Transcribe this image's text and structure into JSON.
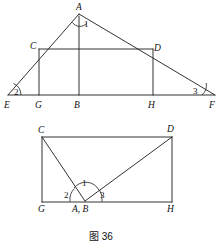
{
  "figure": {
    "caption": "图 36",
    "background_color": "#ffffff",
    "stroke_color": "#1c1c1c",
    "width": 223,
    "height": 251
  },
  "top_figure": {
    "name": "large-triangle-EAF-with-rectangle-CGHD",
    "description": "Triangle E A F with altitude A B, inscribed rectangle C G H D",
    "vertex_labels": [
      {
        "id": "A",
        "text": "A",
        "x": 76,
        "y": 3
      },
      {
        "id": "C",
        "text": "C",
        "x": 30,
        "y": 42
      },
      {
        "id": "D",
        "text": "D",
        "x": 154,
        "y": 44
      },
      {
        "id": "E",
        "text": "E",
        "x": 4,
        "y": 101
      },
      {
        "id": "G",
        "text": "G",
        "x": 35,
        "y": 101
      },
      {
        "id": "B",
        "text": "B",
        "x": 74,
        "y": 101
      },
      {
        "id": "H",
        "text": "H",
        "x": 148,
        "y": 101
      },
      {
        "id": "F",
        "text": "F",
        "x": 209,
        "y": 101
      }
    ],
    "angle_labels": [
      {
        "id": "1",
        "text": "1",
        "x": 84,
        "y": 20
      },
      {
        "id": "2",
        "text": "2",
        "x": 14,
        "y": 88
      },
      {
        "id": "3",
        "text": "3",
        "x": 193,
        "y": 87
      }
    ]
  },
  "bottom_figure": {
    "name": "rectangle-GHDC-with-angles-at-AB",
    "description": "Rectangle C D H G with segments C-AB and D-AB meeting at point A,B on side G H",
    "vertex_labels": [
      {
        "id": "C",
        "text": "C",
        "x": 38,
        "y": 126
      },
      {
        "id": "D",
        "text": "D",
        "x": 167,
        "y": 125
      },
      {
        "id": "G",
        "text": "G",
        "x": 38,
        "y": 205
      },
      {
        "id": "H",
        "text": "H",
        "x": 167,
        "y": 205
      },
      {
        "id": "AB",
        "text": "A, B",
        "x": 72,
        "y": 205
      }
    ],
    "angle_labels": [
      {
        "id": "1",
        "text": "1",
        "x": 82,
        "y": 179
      },
      {
        "id": "2",
        "text": "2",
        "x": 64,
        "y": 191
      },
      {
        "id": "3",
        "text": "3",
        "x": 100,
        "y": 191
      }
    ]
  }
}
